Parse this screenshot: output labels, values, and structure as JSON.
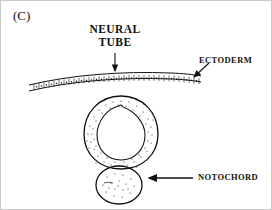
{
  "figure": {
    "panel_letter": "(C)",
    "background_color": "#ffffff",
    "ink_color": "#111111",
    "frame_color": "#c9c9c9"
  },
  "labels": {
    "neural_tube": "NEURAL\nTUBE",
    "neural_tube_line1": "NEURAL",
    "neural_tube_line2": "TUBE",
    "ectoderm": "ECTODERM",
    "notochord": "NOTOCHORD"
  },
  "diagram_data": {
    "type": "biological-cross-section",
    "subject": "vertebrate embryo neurulation cross-section",
    "structures": [
      {
        "name": "ectoderm",
        "shape": "curved epithelial band",
        "description": "single layer of cuboidal cells spanning the width, arching upward at center",
        "cell_count": 34,
        "fill": "none",
        "stroke": "#111111"
      },
      {
        "name": "neural-tube",
        "shape": "oval ring with teardrop lumen",
        "description": "thick stippled wall surrounding a pear-shaped central canal",
        "fill": "stippled",
        "stroke": "#111111"
      },
      {
        "name": "notochord",
        "shape": "small circle",
        "description": "small stippled round body below the neural tube",
        "fill": "stippled",
        "stroke": "#111111"
      }
    ],
    "annotations": [
      {
        "label": "NEURAL TUBE",
        "arrow": "down",
        "points_to": "neural-tube"
      },
      {
        "label": "ECTODERM",
        "arrow": "down-left",
        "points_to": "ectoderm"
      },
      {
        "label": "NOTOCHORD",
        "arrow": "left",
        "points_to": "notochord"
      }
    ]
  }
}
